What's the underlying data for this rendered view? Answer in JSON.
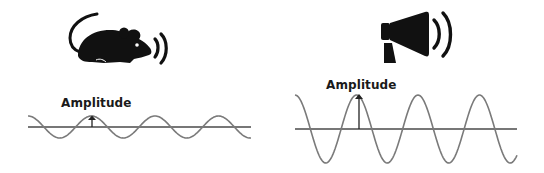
{
  "diagram": {
    "panels": [
      {
        "id": "quiet",
        "icon": "mouse-squeak-icon",
        "amplitude_label": "Amplitude",
        "wave": {
          "baseline_y": 127,
          "amplitude_px": 11,
          "period_px": 63.5,
          "x_start": 28,
          "x_end": 251,
          "stroke": "#7a7a7a"
        }
      },
      {
        "id": "loud",
        "icon": "megaphone-icon",
        "amplitude_label": "Amplitude",
        "wave": {
          "baseline_y": 129,
          "amplitude_px": 34,
          "period_px": 61.5,
          "x_start": 295,
          "x_end": 517,
          "stroke": "#7a7a7a"
        }
      }
    ],
    "colors": {
      "icon": "#111111",
      "wave": "#7a7a7a",
      "axis": "#4a4a4a",
      "text": "#1a1a1a"
    }
  }
}
